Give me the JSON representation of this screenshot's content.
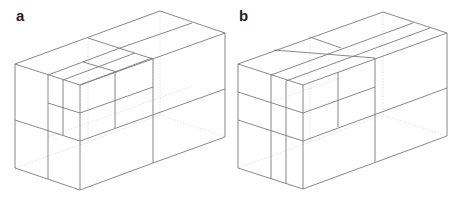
{
  "figure": {
    "panels": [
      {
        "label": "a",
        "label_pos": [
          16,
          8
        ],
        "visible_edges": [
          [
            15,
            64,
            160,
            11
          ],
          [
            160,
            11,
            225,
            33
          ],
          [
            225,
            33,
            80,
            85
          ],
          [
            15,
            64,
            80,
            85
          ],
          [
            15,
            64,
            15,
            168
          ],
          [
            80,
            85,
            80,
            190
          ],
          [
            225,
            33,
            225,
            137
          ],
          [
            15,
            168,
            80,
            190
          ],
          [
            80,
            190,
            153,
            163
          ],
          [
            153,
            163,
            225,
            137
          ],
          [
            153,
            58,
            153,
            163
          ],
          [
            15,
            120,
            80,
            141
          ],
          [
            80,
            141,
            225,
            89
          ],
          [
            48,
            75,
            48,
            179
          ],
          [
            63,
            80,
            63,
            135
          ],
          [
            48,
            103,
            80,
            113
          ],
          [
            80,
            113,
            153,
            87
          ],
          [
            115,
            72,
            115,
            128
          ],
          [
            88,
            38,
            153,
            59
          ],
          [
            48,
            75,
            120,
            48
          ],
          [
            63,
            80,
            135,
            53
          ],
          [
            80,
            85,
            152,
            58
          ],
          [
            83,
            62,
            117,
            72
          ],
          [
            120,
            48,
            192,
            23
          ]
        ],
        "hidden_edges": [
          [
            160,
            11,
            160,
            115
          ],
          [
            15,
            168,
            88,
            142
          ],
          [
            88,
            142,
            160,
            115
          ],
          [
            160,
            115,
            225,
            137
          ],
          [
            88,
            38,
            88,
            142
          ],
          [
            48,
            137,
            120,
            112
          ],
          [
            120,
            112,
            192,
            86
          ]
        ]
      },
      {
        "label": "b",
        "label_pos": [
          239,
          8
        ],
        "visible_edges": [
          [
            238,
            64,
            383,
            12
          ],
          [
            383,
            12,
            447,
            33
          ],
          [
            447,
            33,
            303,
            85
          ],
          [
            238,
            64,
            303,
            85
          ],
          [
            238,
            64,
            238,
            168
          ],
          [
            303,
            85,
            303,
            189
          ],
          [
            447,
            33,
            447,
            136
          ],
          [
            238,
            168,
            303,
            189
          ],
          [
            303,
            189,
            447,
            136
          ],
          [
            375,
            58,
            375,
            162
          ],
          [
            238,
            92,
            303,
            113
          ],
          [
            303,
            113,
            375,
            87
          ],
          [
            238,
            120,
            303,
            141
          ],
          [
            303,
            141,
            447,
            88
          ],
          [
            271,
            75,
            271,
            179
          ],
          [
            286,
            81,
            286,
            184
          ],
          [
            338,
            72,
            338,
            127
          ],
          [
            274,
            50,
            375,
            58
          ],
          [
            271,
            75,
            413,
            23
          ],
          [
            286,
            81,
            430,
            28
          ],
          [
            310,
            37,
            341,
            48
          ]
        ],
        "hidden_edges": [
          [
            383,
            12,
            383,
            115
          ],
          [
            238,
            168,
            310,
            142
          ],
          [
            310,
            142,
            383,
            115
          ],
          [
            383,
            115,
            447,
            136
          ],
          [
            310,
            37,
            310,
            142
          ],
          [
            271,
            102,
            343,
            77
          ]
        ]
      }
    ]
  }
}
